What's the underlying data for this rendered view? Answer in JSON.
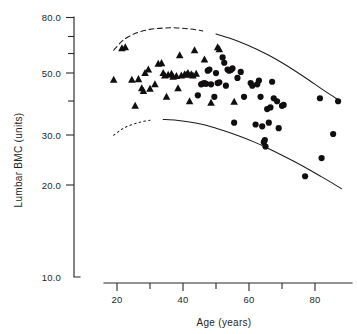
{
  "chart_data": {
    "type": "scatter",
    "title": "",
    "xlabel": "Age (years)",
    "ylabel": "Lumbar BMC (units)",
    "xlim": [
      17,
      89
    ],
    "ylim": [
      10.0,
      80.0
    ],
    "yscale": "log",
    "xticks": [
      20,
      40,
      60,
      80
    ],
    "xtick_labels": [
      "20",
      "40",
      "60",
      "80"
    ],
    "xminor_ticks": [
      30,
      50,
      70
    ],
    "yticks": [
      80.0,
      50.0,
      30.0,
      20.0,
      10.0
    ],
    "ytick_labels": [
      "80.0",
      "50.0",
      "30.0",
      "20.0",
      "10.0"
    ],
    "yminor_ticks": [
      70.0,
      60.0,
      40.0
    ],
    "grid": false,
    "legend": "none",
    "series": [
      {
        "name": "triangles",
        "marker": "triangle",
        "color": "#100e0e",
        "points": [
          [
            19.0,
            47.8
          ],
          [
            21.5,
            62.0
          ],
          [
            22.5,
            62.5
          ],
          [
            24.5,
            47.8
          ],
          [
            25.5,
            38.5
          ],
          [
            26.5,
            48.0
          ],
          [
            27.5,
            44.5
          ],
          [
            28.0,
            43.5
          ],
          [
            28.5,
            50.5
          ],
          [
            29.5,
            52.0
          ],
          [
            30.0,
            44.3
          ],
          [
            31.5,
            46.0
          ],
          [
            32.5,
            54.5
          ],
          [
            33.5,
            54.8
          ],
          [
            34.0,
            50.5
          ],
          [
            34.5,
            49.5
          ],
          [
            35.0,
            41.5
          ],
          [
            35.5,
            49.8
          ],
          [
            36.5,
            50.2
          ],
          [
            37.0,
            49.0
          ],
          [
            38.0,
            49.3
          ],
          [
            38.5,
            44.5
          ],
          [
            39.0,
            58.5
          ],
          [
            39.5,
            49.5
          ],
          [
            40.5,
            50.0
          ],
          [
            41.0,
            49.8
          ],
          [
            41.5,
            50.5
          ],
          [
            42.0,
            40.0
          ],
          [
            42.5,
            50.0
          ],
          [
            43.0,
            49.5
          ],
          [
            43.5,
            61.0
          ],
          [
            44.0,
            50.2
          ],
          [
            46.5,
            56.5
          ],
          [
            48.5,
            39.5
          ],
          [
            50.5,
            62.5
          ],
          [
            51.0,
            61.5
          ],
          [
            55.5,
            39.8
          ]
        ]
      },
      {
        "name": "circles",
        "marker": "circle",
        "color": "#100e0e",
        "points": [
          [
            44.5,
            42.0
          ],
          [
            45.5,
            46.0
          ],
          [
            46.0,
            46.3
          ],
          [
            46.5,
            46.5
          ],
          [
            47.0,
            46.2
          ],
          [
            47.5,
            51.5
          ],
          [
            48.0,
            52.0
          ],
          [
            48.5,
            46.0
          ],
          [
            49.5,
            41.5
          ],
          [
            50.0,
            50.5
          ],
          [
            50.5,
            46.5
          ],
          [
            51.0,
            46.8
          ],
          [
            52.0,
            57.5
          ],
          [
            52.5,
            55.0
          ],
          [
            53.0,
            45.5
          ],
          [
            53.5,
            52.0
          ],
          [
            54.0,
            51.5
          ],
          [
            54.5,
            51.8
          ],
          [
            55.0,
            52.5
          ],
          [
            55.5,
            33.5
          ],
          [
            56.5,
            48.5
          ],
          [
            57.5,
            51.0
          ],
          [
            58.5,
            41.5
          ],
          [
            60.5,
            46.5
          ],
          [
            61.0,
            45.5
          ],
          [
            62.5,
            46.0
          ],
          [
            62.0,
            33.0
          ],
          [
            63.0,
            47.5
          ],
          [
            63.5,
            41.5
          ],
          [
            64.0,
            32.5
          ],
          [
            64.5,
            28.5
          ],
          [
            64.8,
            29.0
          ],
          [
            65.0,
            27.5
          ],
          [
            65.5,
            37.5
          ],
          [
            66.0,
            33.5
          ],
          [
            66.5,
            38.0
          ],
          [
            67.0,
            47.0
          ],
          [
            67.5,
            41.0
          ],
          [
            68.5,
            40.0
          ],
          [
            69.0,
            32.0
          ],
          [
            70.0,
            38.5
          ],
          [
            70.5,
            38.8
          ],
          [
            77.0,
            21.5
          ],
          [
            81.5,
            41.0
          ],
          [
            82.0,
            25.0
          ],
          [
            85.5,
            30.5
          ],
          [
            87.0,
            40.0
          ]
        ]
      }
    ],
    "curves": [
      {
        "name": "upper-reference-curve",
        "style": "dashed-then-solid",
        "dashed_segment": {
          "x_from": 19,
          "x_to": 48
        },
        "solid_segment": {
          "x_from": 48,
          "x_to": 87
        },
        "points": [
          [
            19,
            61.0
          ],
          [
            22,
            66.5
          ],
          [
            26,
            70.5
          ],
          [
            30,
            72.5
          ],
          [
            34,
            73.3
          ],
          [
            38,
            73.4
          ],
          [
            42,
            72.8
          ],
          [
            46,
            71.6
          ],
          [
            50,
            69.8
          ],
          [
            54,
            67.5
          ],
          [
            58,
            64.8
          ],
          [
            62,
            61.8
          ],
          [
            66,
            58.5
          ],
          [
            70,
            55.0
          ],
          [
            74,
            51.4
          ],
          [
            78,
            47.8
          ],
          [
            82,
            44.3
          ],
          [
            85,
            42.0
          ],
          [
            87,
            40.5
          ]
        ]
      },
      {
        "name": "lower-reference-curve",
        "style": "dotted-then-solid",
        "dotted_segment": {
          "x_from": 19,
          "x_to": 33
        },
        "solid_segment": {
          "x_from": 33,
          "x_to": 88
        },
        "points": [
          [
            19,
            30.2
          ],
          [
            22,
            32.0
          ],
          [
            26,
            33.4
          ],
          [
            30,
            34.2
          ],
          [
            34,
            34.4
          ],
          [
            38,
            34.2
          ],
          [
            42,
            33.7
          ],
          [
            46,
            33.0
          ],
          [
            50,
            32.0
          ],
          [
            54,
            30.9
          ],
          [
            58,
            29.7
          ],
          [
            62,
            28.4
          ],
          [
            66,
            27.0
          ],
          [
            70,
            25.6
          ],
          [
            74,
            24.2
          ],
          [
            78,
            22.8
          ],
          [
            82,
            21.4
          ],
          [
            85,
            20.4
          ],
          [
            88,
            19.4
          ]
        ]
      }
    ]
  }
}
